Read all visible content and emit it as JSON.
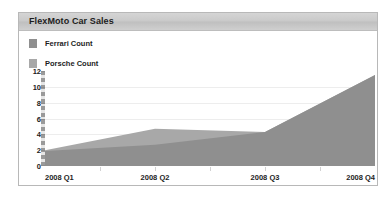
{
  "panel": {
    "title": "FlexMoto Car Sales"
  },
  "legend": {
    "position": "top-left",
    "items": [
      {
        "label": "Ferrari Count",
        "color": "#8f8f8f",
        "swatch": "legend-swatch-ferrari"
      },
      {
        "label": "Porsche Count",
        "color": "#a8a8a8",
        "swatch": "legend-swatch-porsche"
      }
    ]
  },
  "chart_data": {
    "type": "area",
    "title": "FlexMoto Car Sales",
    "xlabel": "",
    "ylabel": "",
    "categories": [
      "2008 Q1",
      "2008 Q2",
      "2008 Q3",
      "2008 Q4"
    ],
    "x_ticks": [
      "2008 Q1",
      "2008 Q2",
      "2008 Q3",
      "2008 Q4"
    ],
    "y_ticks": [
      0,
      2,
      4,
      6,
      8,
      10,
      12
    ],
    "ylim": [
      0,
      12
    ],
    "grid": true,
    "stacked": false,
    "legend_position": "top-left",
    "series": [
      {
        "name": "Ferrari Count",
        "color": "#8f8f8f",
        "values": [
          1.9,
          2.7,
          4.3,
          11.5
        ],
        "points": [
          {
            "x": "2008 Q1",
            "y": 1.9
          },
          {
            "x": "2008 Q2",
            "y": 2.7
          },
          {
            "x": "2008 Q3",
            "y": 4.3
          },
          {
            "x": "2008 Q4",
            "y": 11.5
          }
        ]
      },
      {
        "name": "Porsche Count",
        "color": "#a8a8a8",
        "values": [
          2.0,
          4.7,
          4.3,
          11.5
        ],
        "points": [
          {
            "x": "2008 Q1",
            "y": 2.0
          },
          {
            "x": "2008 Q2",
            "y": 4.7
          },
          {
            "x": "2008 Q3",
            "y": 4.3
          },
          {
            "x": "2008 Q4",
            "y": 11.5
          }
        ]
      }
    ]
  },
  "colors": {
    "panel_border": "#b8b8b8",
    "header_band": "#c9c9c9",
    "grid": "#ededed",
    "axis": "#9a9a9a",
    "text": "#1d1d1d"
  }
}
